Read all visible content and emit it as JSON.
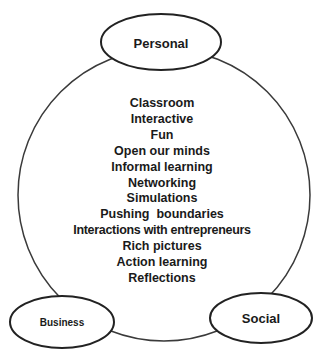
{
  "diagram": {
    "type": "concept-circle",
    "nodes": {
      "personal": {
        "label": "Personal"
      },
      "business": {
        "label": "Business"
      },
      "social": {
        "label": "Social"
      }
    },
    "items": [
      "Classroom",
      "Interactive",
      "Fun",
      "Open our minds",
      "Informal learning",
      "Networking",
      "Simulations",
      "Pushing  boundaries",
      "Interactions with entrepreneurs",
      "Rich pictures",
      "Action learning",
      "Reflections"
    ],
    "colors": {
      "stroke": "#2a2a2a",
      "text": "#1a1a1a",
      "background": "#ffffff"
    }
  }
}
